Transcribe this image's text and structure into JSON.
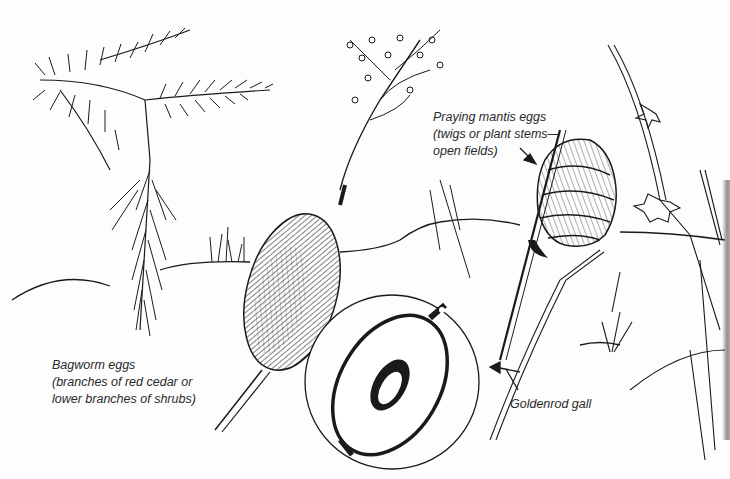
{
  "illustration": {
    "style": "pen-and-ink line drawing",
    "colors": {
      "ink": "#1a1a1a",
      "paper": "#fdfdfd",
      "label_text": "#2a2a2a"
    },
    "subjects": [
      {
        "id": "bagworm",
        "name": "Bagworm eggs",
        "depiction": "red cedar branch with hanging bag"
      },
      {
        "id": "gall-whole",
        "name": "Goldenrod gall",
        "depiction": "spherical swelling on stem"
      },
      {
        "id": "gall-cross-section",
        "name": "Goldenrod gall cross-section",
        "depiction": "circular inset showing larva inside gall"
      },
      {
        "id": "mantis",
        "name": "Praying mantis eggs",
        "depiction": "foamy egg case on plant stem"
      }
    ]
  },
  "labels": {
    "mantis": {
      "line1": "Praying mantis eggs",
      "line2": "(twigs or plant stems—",
      "line3": "open fields)"
    },
    "bagworm": {
      "line1": "Bagworm eggs",
      "line2": "(branches of red cedar or",
      "line3": "lower branches of shrubs)"
    },
    "goldenrod": {
      "line1": "Goldenrod gall"
    }
  }
}
